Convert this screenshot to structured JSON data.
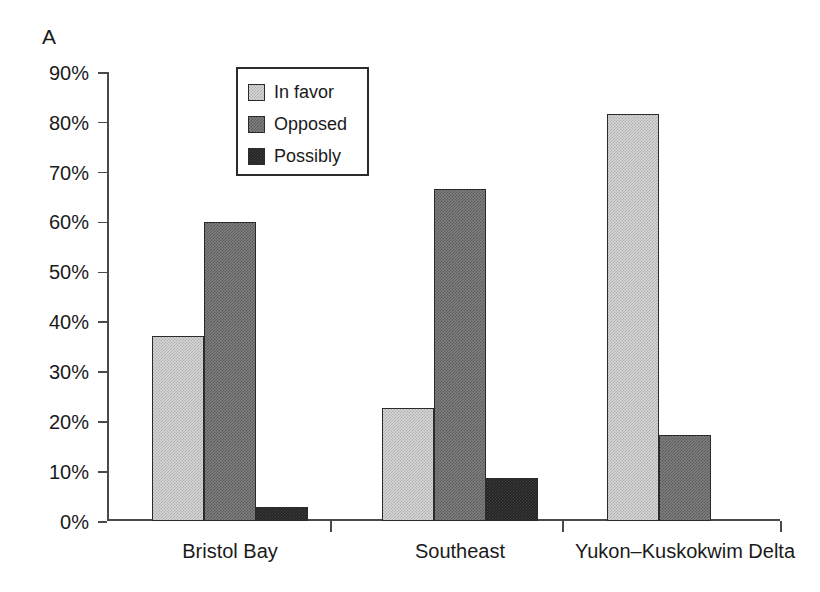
{
  "panel": {
    "label": "A"
  },
  "legend": {
    "position": "upper-left-inside",
    "entries": [
      {
        "key": "in_favor",
        "label": "In favor",
        "color": "#d6d6d6",
        "swatch_icon": "legend-swatch-in-favor"
      },
      {
        "key": "opposed",
        "label": "Opposed",
        "color": "#7f7f7f",
        "swatch_icon": "legend-swatch-opposed"
      },
      {
        "key": "possibly",
        "label": "Possibly",
        "color": "#232323",
        "swatch_icon": "legend-swatch-possibly"
      }
    ]
  },
  "axes": {
    "y_ticks": [
      "0%",
      "10%",
      "20%",
      "30%",
      "40%",
      "50%",
      "60%",
      "70%",
      "80%",
      "90%"
    ],
    "y_tick_values": [
      0,
      10,
      20,
      30,
      40,
      50,
      60,
      70,
      80,
      90
    ]
  },
  "chart_data": {
    "type": "bar",
    "title": "",
    "subtitle": "",
    "xlabel": "",
    "ylabel": "",
    "ylim": [
      0,
      90
    ],
    "ytick_interval": 10,
    "yticks": [
      0,
      10,
      20,
      30,
      40,
      50,
      60,
      70,
      80,
      90
    ],
    "ytick_labels": [
      "0%",
      "10%",
      "20%",
      "30%",
      "40%",
      "50%",
      "60%",
      "70%",
      "80%",
      "90%"
    ],
    "y_unit": "percent",
    "grid": false,
    "legend": [
      "In favor",
      "Opposed",
      "Possibly"
    ],
    "legend_position": "upper left (inside plot)",
    "categories": [
      "Bristol Bay",
      "Southeast",
      "Yukon–Kuskokwim Delta"
    ],
    "series": [
      {
        "name": "In favor",
        "color": "#d6d6d6",
        "values": [
          37.0,
          22.6,
          81.5
        ]
      },
      {
        "name": "Opposed",
        "color": "#7f7f7f",
        "values": [
          60.0,
          66.5,
          17.3
        ]
      },
      {
        "name": "Possibly",
        "color": "#232323",
        "values": [
          2.8,
          8.6,
          0
        ]
      }
    ],
    "annotations": [
      "A"
    ]
  },
  "layout": {
    "group_centers_pct": [
      0.205,
      0.49,
      0.755
    ],
    "bar_width_px": 52,
    "group_start_px": [
      45,
      275,
      500
    ],
    "group_divider_px": [
      223,
      455,
      673
    ]
  }
}
